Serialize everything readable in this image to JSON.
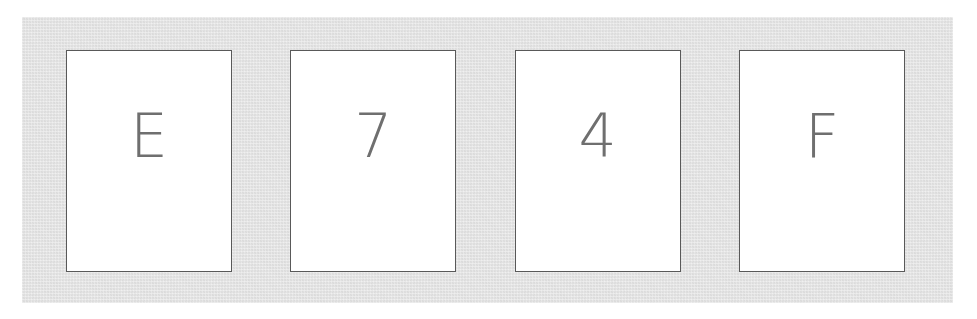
{
  "canvas": {
    "width": 977,
    "height": 319,
    "background_color": "#ffffff"
  },
  "panel": {
    "name": "card-tray",
    "background_color": "#e3e3e3",
    "x": 22,
    "y": 17,
    "width": 931,
    "height": 286
  },
  "cards": {
    "count": 4,
    "card_background_color": "#ffffff",
    "card_border_color": "#595959",
    "glyph_color": "#6f6f6f",
    "card_width": 166,
    "card_height": 222,
    "gap": 58,
    "items": [
      {
        "glyph": "E",
        "position": 1
      },
      {
        "glyph": "7",
        "position": 2
      },
      {
        "glyph": "4",
        "position": 3
      },
      {
        "glyph": "F",
        "position": 4
      }
    ]
  },
  "sequence_text": "E74F"
}
